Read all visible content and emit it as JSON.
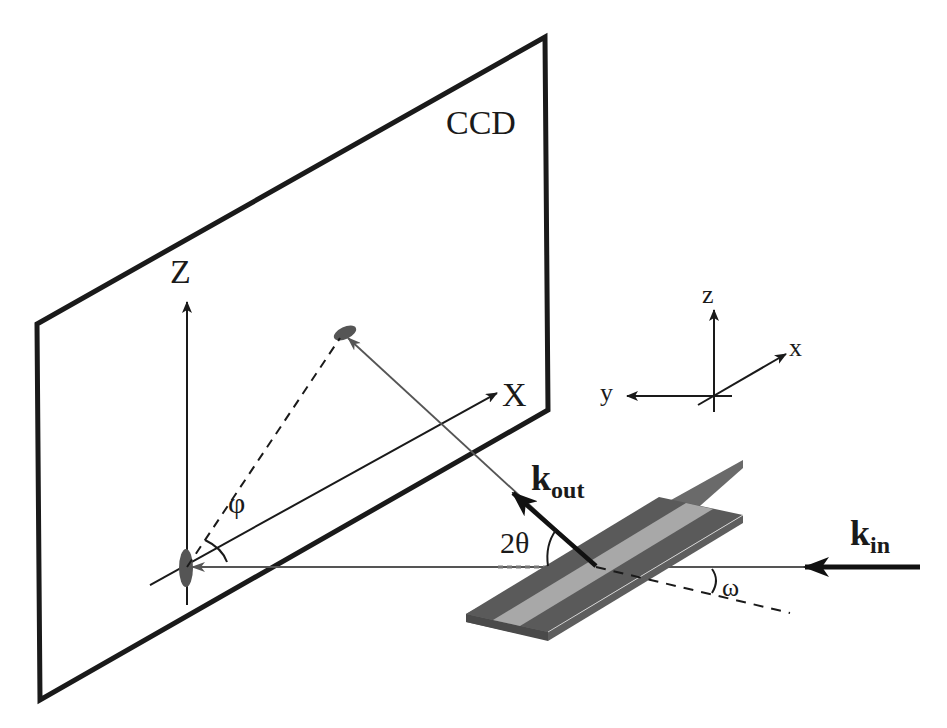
{
  "diagram": {
    "type": "experimental-geometry",
    "labels": {
      "detector": "CCD",
      "detector_axis_z": "Z",
      "detector_axis_x": "X",
      "sample_axis_z": "z",
      "sample_axis_x": "x",
      "sample_axis_y": "y",
      "azimuth_angle": "φ",
      "scattering_angle": "2θ",
      "incidence_angle": "ω",
      "k_out_main": "k",
      "k_out_sub": "out",
      "k_in_main": "k",
      "k_in_sub": "in"
    },
    "colors": {
      "line": "#1a1a1a",
      "thin_line": "#555555",
      "sample_dark": "#5a5a5a",
      "sample_light": "#a8a8a8",
      "spot": "#555555"
    }
  }
}
